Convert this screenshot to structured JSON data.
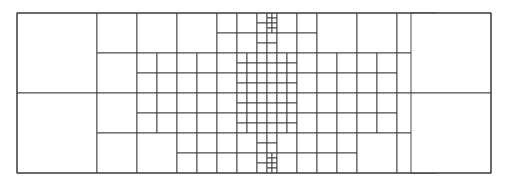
{
  "figure": {
    "type": "mesh-diagram"
  },
  "canvas": {
    "width": 509,
    "height": 186,
    "background_color": "#ffffff"
  },
  "domain": {
    "x": 17,
    "y": 13,
    "width": 474,
    "height": 160,
    "label": "mesh-domain"
  },
  "style": {
    "line_color": "#3a3a3a",
    "cell_fill": "#ffffff",
    "line_width": 0.9,
    "frame_line_width": 1.1
  },
  "chart_data": {
    "type": "mesh",
    "xlabel": "",
    "ylabel": "",
    "xlim": [
      0,
      474
    ],
    "ylim": [
      0,
      160
    ],
    "grid": false,
    "legend": [],
    "refinement": {
      "base_cell_size": 80,
      "levels": 5,
      "level_sizes": [
        80,
        40,
        20,
        10,
        5
      ],
      "center": [
        237,
        80
      ],
      "note": "Cell size halves with each refinement level toward the centre; mesh is symmetric about both the vertical and horizontal mid-lines."
    },
    "cells": [
      [
        0,
        0,
        80,
        80
      ],
      [
        0,
        80,
        80,
        80
      ],
      [
        80,
        0,
        40,
        40
      ],
      [
        120,
        0,
        40,
        40
      ],
      [
        80,
        40,
        40,
        40
      ],
      [
        120,
        40,
        20,
        20
      ],
      [
        140,
        40,
        20,
        20
      ],
      [
        120,
        60,
        20,
        20
      ],
      [
        140,
        60,
        20,
        20
      ],
      [
        80,
        80,
        40,
        40
      ],
      [
        120,
        80,
        20,
        20
      ],
      [
        140,
        80,
        20,
        20
      ],
      [
        120,
        100,
        20,
        20
      ],
      [
        140,
        100,
        20,
        20
      ],
      [
        80,
        120,
        40,
        40
      ],
      [
        120,
        120,
        40,
        40
      ],
      [
        160,
        0,
        40,
        40
      ],
      [
        160,
        40,
        20,
        20
      ],
      [
        180,
        40,
        20,
        20
      ],
      [
        160,
        60,
        20,
        20
      ],
      [
        180,
        60,
        20,
        20
      ],
      [
        160,
        80,
        20,
        20
      ],
      [
        180,
        80,
        20,
        20
      ],
      [
        160,
        100,
        20,
        20
      ],
      [
        180,
        100,
        20,
        20
      ],
      [
        160,
        120,
        20,
        20
      ],
      [
        180,
        120,
        20,
        20
      ],
      [
        160,
        140,
        20,
        20
      ],
      [
        180,
        140,
        20,
        20
      ],
      [
        200,
        0,
        20,
        20
      ],
      [
        220,
        0,
        20,
        20
      ],
      [
        200,
        20,
        20,
        20
      ],
      [
        220,
        20,
        20,
        20
      ],
      [
        200,
        40,
        20,
        20
      ],
      [
        220,
        40,
        10,
        10
      ],
      [
        230,
        40,
        10,
        10
      ],
      [
        220,
        50,
        10,
        10
      ],
      [
        230,
        50,
        10,
        10
      ],
      [
        200,
        60,
        20,
        20
      ],
      [
        220,
        60,
        10,
        10
      ],
      [
        230,
        60,
        10,
        10
      ],
      [
        220,
        70,
        10,
        10
      ],
      [
        230,
        70,
        10,
        10
      ],
      [
        200,
        80,
        20,
        20
      ],
      [
        220,
        80,
        10,
        10
      ],
      [
        230,
        80,
        10,
        10
      ],
      [
        220,
        90,
        10,
        10
      ],
      [
        230,
        90,
        10,
        10
      ],
      [
        200,
        100,
        20,
        20
      ],
      [
        220,
        100,
        10,
        10
      ],
      [
        230,
        100,
        10,
        10
      ],
      [
        220,
        110,
        10,
        10
      ],
      [
        230,
        110,
        10,
        10
      ],
      [
        200,
        120,
        20,
        20
      ],
      [
        220,
        120,
        20,
        20
      ],
      [
        200,
        140,
        20,
        20
      ],
      [
        220,
        140,
        20,
        20
      ],
      [
        240,
        0,
        10,
        10
      ],
      [
        250,
        0,
        5,
        5
      ],
      [
        255,
        0,
        5,
        5
      ],
      [
        250,
        5,
        5,
        5
      ],
      [
        255,
        5,
        5,
        5
      ],
      [
        240,
        10,
        10,
        10
      ],
      [
        250,
        10,
        5,
        5
      ],
      [
        255,
        10,
        5,
        5
      ],
      [
        250,
        15,
        5,
        5
      ],
      [
        255,
        15,
        5,
        5
      ],
      [
        240,
        20,
        10,
        10
      ],
      [
        250,
        20,
        10,
        10
      ],
      [
        240,
        30,
        10,
        10
      ],
      [
        250,
        30,
        10,
        10
      ],
      [
        240,
        40,
        10,
        10
      ],
      [
        250,
        40,
        10,
        10
      ],
      [
        240,
        50,
        10,
        10
      ],
      [
        250,
        50,
        10,
        10
      ],
      [
        240,
        60,
        10,
        10
      ],
      [
        250,
        60,
        10,
        10
      ],
      [
        240,
        70,
        10,
        10
      ],
      [
        250,
        70,
        10,
        10
      ],
      [
        240,
        80,
        10,
        10
      ],
      [
        250,
        80,
        10,
        10
      ],
      [
        240,
        90,
        10,
        10
      ],
      [
        250,
        90,
        10,
        10
      ],
      [
        240,
        100,
        10,
        10
      ],
      [
        250,
        100,
        10,
        10
      ],
      [
        240,
        110,
        10,
        10
      ],
      [
        250,
        110,
        10,
        10
      ],
      [
        240,
        120,
        10,
        10
      ],
      [
        250,
        120,
        10,
        10
      ],
      [
        240,
        130,
        10,
        10
      ],
      [
        250,
        130,
        10,
        10
      ],
      [
        240,
        140,
        10,
        10
      ],
      [
        250,
        140,
        5,
        5
      ],
      [
        255,
        140,
        5,
        5
      ],
      [
        250,
        145,
        5,
        5
      ],
      [
        255,
        145,
        5,
        5
      ],
      [
        240,
        150,
        10,
        10
      ],
      [
        250,
        150,
        5,
        5
      ],
      [
        255,
        150,
        5,
        5
      ],
      [
        250,
        155,
        5,
        5
      ],
      [
        255,
        155,
        5,
        5
      ],
      [
        260,
        0,
        20,
        20
      ],
      [
        260,
        20,
        20,
        20
      ],
      [
        260,
        40,
        10,
        10
      ],
      [
        270,
        40,
        10,
        10
      ],
      [
        260,
        50,
        10,
        10
      ],
      [
        270,
        50,
        10,
        10
      ],
      [
        260,
        60,
        10,
        10
      ],
      [
        270,
        60,
        10,
        10
      ],
      [
        260,
        70,
        10,
        10
      ],
      [
        270,
        70,
        10,
        10
      ],
      [
        260,
        80,
        10,
        10
      ],
      [
        270,
        80,
        10,
        10
      ],
      [
        260,
        90,
        10,
        10
      ],
      [
        270,
        90,
        10,
        10
      ],
      [
        260,
        100,
        10,
        10
      ],
      [
        270,
        100,
        10,
        10
      ],
      [
        260,
        110,
        10,
        10
      ],
      [
        270,
        110,
        10,
        10
      ],
      [
        260,
        120,
        20,
        20
      ],
      [
        260,
        140,
        20,
        20
      ],
      [
        280,
        0,
        20,
        20
      ],
      [
        280,
        20,
        20,
        20
      ],
      [
        280,
        40,
        20,
        20
      ],
      [
        280,
        60,
        20,
        20
      ],
      [
        280,
        80,
        20,
        20
      ],
      [
        280,
        100,
        20,
        20
      ],
      [
        280,
        120,
        20,
        20
      ],
      [
        280,
        140,
        20,
        20
      ],
      [
        300,
        0,
        40,
        40
      ],
      [
        300,
        40,
        20,
        20
      ],
      [
        320,
        40,
        20,
        20
      ],
      [
        300,
        60,
        20,
        20
      ],
      [
        320,
        60,
        20,
        20
      ],
      [
        300,
        80,
        20,
        20
      ],
      [
        320,
        80,
        20,
        20
      ],
      [
        300,
        100,
        20,
        20
      ],
      [
        320,
        100,
        20,
        20
      ],
      [
        300,
        120,
        20,
        20
      ],
      [
        320,
        120,
        20,
        20
      ],
      [
        300,
        140,
        20,
        20
      ],
      [
        320,
        140,
        20,
        20
      ],
      [
        340,
        0,
        40,
        40
      ],
      [
        340,
        40,
        20,
        20
      ],
      [
        360,
        40,
        20,
        20
      ],
      [
        340,
        60,
        20,
        20
      ],
      [
        360,
        60,
        20,
        20
      ],
      [
        340,
        80,
        20,
        20
      ],
      [
        360,
        80,
        20,
        20
      ],
      [
        340,
        100,
        20,
        20
      ],
      [
        360,
        100,
        20,
        20
      ],
      [
        340,
        120,
        40,
        40
      ],
      [
        380,
        0,
        40,
        40
      ],
      [
        380,
        40,
        40,
        40
      ],
      [
        380,
        80,
        40,
        40
      ],
      [
        380,
        120,
        40,
        40
      ],
      [
        394,
        0,
        80,
        80
      ],
      [
        394,
        80,
        80,
        80
      ]
    ]
  }
}
